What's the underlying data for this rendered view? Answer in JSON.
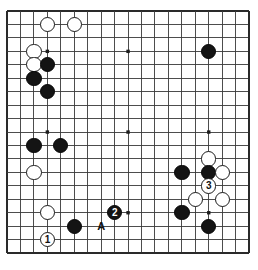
{
  "diagram": {
    "kind": "go-board-diagram",
    "board_size": 19,
    "title": "",
    "geometry": {
      "image_width": 258,
      "image_height": 270,
      "grid_left": 7.0,
      "grid_top": 11.0,
      "cell": 13.45,
      "stone_diameter": 15.4,
      "line_color": "#3a3a3a",
      "border_color": "#2a2a2a",
      "background_color": "#ffffff"
    },
    "star_points": [
      {
        "col": 3,
        "row": 3
      },
      {
        "col": 9,
        "row": 3
      },
      {
        "col": 15,
        "row": 3
      },
      {
        "col": 3,
        "row": 9
      },
      {
        "col": 9,
        "row": 9
      },
      {
        "col": 15,
        "row": 9
      },
      {
        "col": 3,
        "row": 15
      },
      {
        "col": 9,
        "row": 15
      },
      {
        "col": 15,
        "row": 15
      }
    ],
    "stones": [
      {
        "color": "white",
        "col": 3,
        "row": 1,
        "label": ""
      },
      {
        "color": "white",
        "col": 5,
        "row": 1,
        "label": ""
      },
      {
        "color": "white",
        "col": 2,
        "row": 3,
        "label": ""
      },
      {
        "color": "white",
        "col": 2,
        "row": 4,
        "label": ""
      },
      {
        "color": "black",
        "col": 3,
        "row": 4,
        "label": ""
      },
      {
        "color": "black",
        "col": 2,
        "row": 5,
        "label": ""
      },
      {
        "color": "black",
        "col": 3,
        "row": 6,
        "label": ""
      },
      {
        "color": "black",
        "col": 15,
        "row": 3,
        "label": ""
      },
      {
        "color": "black",
        "col": 2,
        "row": 10,
        "label": ""
      },
      {
        "color": "black",
        "col": 4,
        "row": 10,
        "label": ""
      },
      {
        "color": "white",
        "col": 2,
        "row": 12,
        "label": ""
      },
      {
        "color": "white",
        "col": 15,
        "row": 11,
        "label": ""
      },
      {
        "color": "black",
        "col": 13,
        "row": 12,
        "label": ""
      },
      {
        "color": "black",
        "col": 15,
        "row": 12,
        "label": ""
      },
      {
        "color": "white",
        "col": 16,
        "row": 12,
        "label": ""
      },
      {
        "color": "white",
        "col": 15,
        "row": 13,
        "label": "3"
      },
      {
        "color": "white",
        "col": 14,
        "row": 14,
        "label": ""
      },
      {
        "color": "white",
        "col": 16,
        "row": 14,
        "label": ""
      },
      {
        "color": "white",
        "col": 3,
        "row": 15,
        "label": ""
      },
      {
        "color": "black",
        "col": 13,
        "row": 15,
        "label": ""
      },
      {
        "color": "black",
        "col": 8,
        "row": 15,
        "label": "2"
      },
      {
        "color": "black",
        "col": 5,
        "row": 16,
        "label": ""
      },
      {
        "color": "black",
        "col": 15,
        "row": 16,
        "label": ""
      },
      {
        "color": "white",
        "col": 3,
        "row": 17,
        "label": "1"
      }
    ],
    "markers": [
      {
        "text": "A",
        "col": 7,
        "row": 16
      }
    ],
    "move_numbers": [
      "1",
      "2",
      "3"
    ],
    "letter_markers": [
      "A"
    ]
  }
}
